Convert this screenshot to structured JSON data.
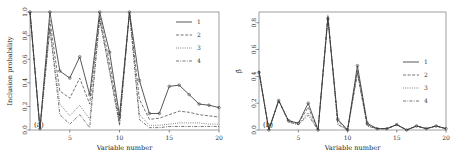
{
  "figure": {
    "panels": [
      {
        "tag": "(a)",
        "xlabel": "Variable number",
        "ylabel": "Inclusion probability"
      },
      {
        "tag": "(b)",
        "xlabel": "Variable number",
        "ylabel": "β̂"
      }
    ],
    "legend_labels": [
      "1",
      "2",
      "3",
      "4"
    ],
    "line_color": "#3a3a3a"
  },
  "chart_data": [
    {
      "type": "line",
      "title": "(a)",
      "xlabel": "Variable number",
      "ylabel": "Inclusion probability",
      "xlim": [
        1,
        20
      ],
      "ylim": [
        0.0,
        1.0
      ],
      "xticks": [
        5,
        10,
        15,
        20
      ],
      "yticks": [
        0.0,
        0.2,
        0.4,
        0.6,
        0.8,
        1.0
      ],
      "grid": false,
      "legend_position": "top-right",
      "x": [
        1,
        2,
        3,
        4,
        5,
        6,
        7,
        8,
        9,
        10,
        11,
        12,
        13,
        14,
        15,
        16,
        17,
        18,
        19,
        20
      ],
      "series": [
        {
          "name": "1",
          "style": "solid",
          "values": [
            1.0,
            0.01,
            1.0,
            0.5,
            0.44,
            0.62,
            0.3,
            1.0,
            0.66,
            0.12,
            1.0,
            0.42,
            0.14,
            0.14,
            0.37,
            0.38,
            0.3,
            0.22,
            0.21,
            0.19
          ]
        },
        {
          "name": "2",
          "style": "dashed",
          "values": [
            1.0,
            0.01,
            0.93,
            0.33,
            0.27,
            0.44,
            0.22,
            0.97,
            0.57,
            0.08,
            1.0,
            0.26,
            0.09,
            0.1,
            0.13,
            0.16,
            0.15,
            0.13,
            0.12,
            0.11
          ]
        },
        {
          "name": "3",
          "style": "dotted",
          "values": [
            1.0,
            0.01,
            0.86,
            0.22,
            0.12,
            0.21,
            0.09,
            0.94,
            0.5,
            0.05,
            1.0,
            0.13,
            0.04,
            0.04,
            0.05,
            0.06,
            0.06,
            0.06,
            0.05,
            0.05
          ]
        },
        {
          "name": "4",
          "style": "dashdot",
          "values": [
            1.0,
            0.01,
            0.86,
            0.13,
            0.05,
            0.13,
            0.02,
            0.94,
            0.5,
            0.04,
            1.0,
            0.09,
            0.02,
            0.02,
            0.03,
            0.03,
            0.03,
            0.03,
            0.03,
            0.03
          ]
        }
      ]
    },
    {
      "type": "line",
      "title": "(b)",
      "xlabel": "Variable number",
      "ylabel": "β̂",
      "xlim": [
        1,
        20
      ],
      "ylim": [
        0.0,
        0.88
      ],
      "xticks": [
        5,
        10,
        15,
        20
      ],
      "yticks": [
        0.0,
        0.2,
        0.4,
        0.6,
        0.8
      ],
      "grid": false,
      "legend_position": "right",
      "x": [
        1,
        2,
        3,
        4,
        5,
        6,
        7,
        8,
        9,
        10,
        11,
        12,
        13,
        14,
        15,
        16,
        17,
        18,
        19,
        20
      ],
      "series": [
        {
          "name": "1",
          "style": "solid",
          "values": [
            0.43,
            0.0,
            0.22,
            0.07,
            0.05,
            0.2,
            0.0,
            0.83,
            0.08,
            0.0,
            0.48,
            0.05,
            0.01,
            0.01,
            0.04,
            0.0,
            0.03,
            0.01,
            0.03,
            0.01
          ]
        },
        {
          "name": "2",
          "style": "dashed",
          "values": [
            0.44,
            0.0,
            0.22,
            0.07,
            0.05,
            0.17,
            0.0,
            0.84,
            0.07,
            0.0,
            0.45,
            0.04,
            0.01,
            0.01,
            0.04,
            0.0,
            0.03,
            0.01,
            0.03,
            0.01
          ]
        },
        {
          "name": "3",
          "style": "dotted",
          "values": [
            0.44,
            0.0,
            0.22,
            0.06,
            0.04,
            0.13,
            0.0,
            0.85,
            0.05,
            0.0,
            0.43,
            0.03,
            0.01,
            0.01,
            0.04,
            0.0,
            0.03,
            0.01,
            0.03,
            0.01
          ]
        },
        {
          "name": "4",
          "style": "dashdot",
          "values": [
            0.44,
            0.0,
            0.22,
            0.06,
            0.04,
            0.11,
            0.0,
            0.86,
            0.04,
            0.0,
            0.42,
            0.03,
            0.01,
            0.01,
            0.04,
            0.0,
            0.03,
            0.01,
            0.03,
            0.01
          ]
        }
      ]
    }
  ]
}
